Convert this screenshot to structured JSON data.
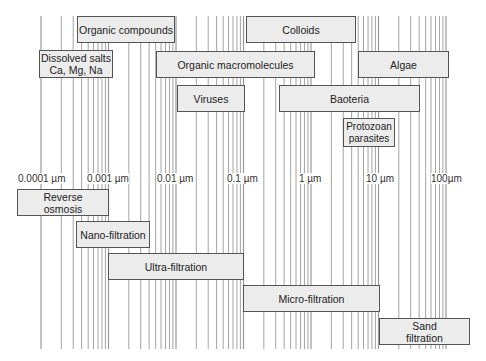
{
  "axis": {
    "unit": "µm",
    "scale": "log",
    "ticks": [
      {
        "label": "0.0001 µm",
        "value": 0.0001
      },
      {
        "label": "0.001 µm",
        "value": 0.001
      },
      {
        "label": "0.01 µm",
        "value": 0.01
      },
      {
        "label": "0.1 µm",
        "value": 0.1
      },
      {
        "label": "1 µm",
        "value": 1
      },
      {
        "label": "10 µm",
        "value": 10
      },
      {
        "label": "100µm",
        "value": 100
      }
    ]
  },
  "contaminants": [
    {
      "label": "Organic compounds"
    },
    {
      "label": "Colloids"
    },
    {
      "label": "Dissolved salts\nCa, Mg, Na"
    },
    {
      "label": "Organic macromolecules"
    },
    {
      "label": "Algae"
    },
    {
      "label": "Viruses"
    },
    {
      "label": "Baoteria"
    },
    {
      "label": "Protozoan\nparasites"
    }
  ],
  "processes": [
    {
      "label": "Reverse\nosmosis"
    },
    {
      "label": "Nano-filtration"
    },
    {
      "label": "Ultra-filtration"
    },
    {
      "label": "Micro-filtration"
    },
    {
      "label": "Sand\nfiltration"
    }
  ],
  "colors": {
    "box_fill": "#ececec",
    "box_border": "#555555",
    "grid_line": "#9a9a9a",
    "background": "#ffffff"
  }
}
